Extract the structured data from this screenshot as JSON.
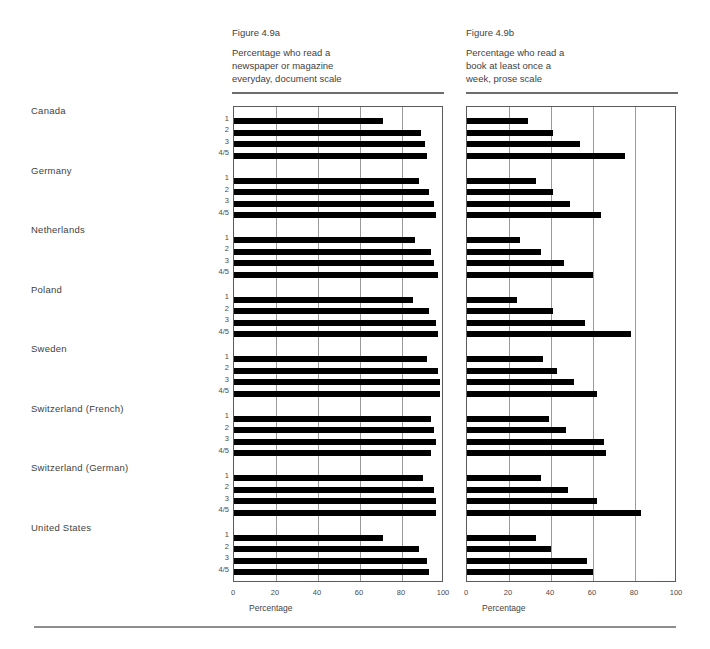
{
  "figure": {
    "panels": [
      {
        "id": "4.9a",
        "number": "Figure 4.9a",
        "description": "Percentage who read a\nnewspaper or magazine\neveryday, document scale",
        "axis_title": "Percentage",
        "ticks": [
          "0",
          "20",
          "40",
          "60",
          "80",
          "100"
        ]
      },
      {
        "id": "4.9b",
        "number": "Figure 4.9b",
        "description": "Percentage who read a\nbook at least once a\nweek, prose scale",
        "axis_title": "Percentage",
        "ticks": [
          "0",
          "20",
          "40",
          "60",
          "80",
          "100"
        ]
      }
    ],
    "countries": [
      "Canada",
      "Germany",
      "Netherlands",
      "Poland",
      "Sweden",
      "Switzerland (French)",
      "Switzerland (German)",
      "United States"
    ],
    "levels": [
      "1",
      "2",
      "3",
      "4/5"
    ]
  },
  "chart_data": {
    "type": "bar",
    "orientation": "horizontal",
    "xlabel": "Percentage",
    "ylabel": "",
    "xlim": [
      0,
      100
    ],
    "xticks": [
      0,
      20,
      40,
      60,
      80,
      100
    ],
    "grid": true,
    "legend": "none",
    "groups": [
      "Canada",
      "Germany",
      "Netherlands",
      "Poland",
      "Sweden",
      "Switzerland (French)",
      "Switzerland (German)",
      "United States"
    ],
    "categories": [
      "1",
      "2",
      "3",
      "4/5"
    ],
    "panels": [
      {
        "id": "4.9a",
        "title": "Figure 4.9a",
        "subtitle": "Percentage who read a newspaper or magazine everyday, document scale",
        "xlabel": "Percentage",
        "xlim": [
          0,
          100
        ],
        "series": [
          {
            "name": "Canada",
            "values": [
              71,
              89,
              91,
              92
            ]
          },
          {
            "name": "Germany",
            "values": [
              88,
              93,
              95,
              96
            ]
          },
          {
            "name": "Netherlands",
            "values": [
              86,
              94,
              95,
              97
            ]
          },
          {
            "name": "Poland",
            "values": [
              85,
              93,
              96,
              97
            ]
          },
          {
            "name": "Sweden",
            "values": [
              92,
              97,
              98,
              98
            ]
          },
          {
            "name": "Switzerland (French)",
            "values": [
              94,
              95,
              96,
              94
            ]
          },
          {
            "name": "Switzerland (German)",
            "values": [
              90,
              95,
              96,
              96
            ]
          },
          {
            "name": "United States",
            "values": [
              71,
              88,
              92,
              93
            ]
          }
        ]
      },
      {
        "id": "4.9b",
        "title": "Figure 4.9b",
        "subtitle": "Percentage who read a book at least once a week, prose scale",
        "xlabel": "Percentage",
        "xlim": [
          0,
          100
        ],
        "series": [
          {
            "name": "Canada",
            "values": [
              29,
              41,
              54,
              75
            ]
          },
          {
            "name": "Germany",
            "values": [
              33,
              41,
              49,
              64
            ]
          },
          {
            "name": "Netherlands",
            "values": [
              25,
              35,
              46,
              60
            ]
          },
          {
            "name": "Poland",
            "values": [
              24,
              41,
              56,
              78
            ]
          },
          {
            "name": "Sweden",
            "values": [
              36,
              43,
              51,
              62
            ]
          },
          {
            "name": "Switzerland (French)",
            "values": [
              39,
              47,
              65,
              66
            ]
          },
          {
            "name": "Switzerland (German)",
            "values": [
              35,
              48,
              62,
              83
            ]
          },
          {
            "name": "United States",
            "values": [
              33,
              40,
              57,
              60
            ]
          }
        ]
      }
    ]
  },
  "colors": {
    "bar": "#000000",
    "grid": "#9a9a9a",
    "axis": "#5a5a5a",
    "text": "#3f3f3f",
    "rule": "#6d6d6d"
  }
}
